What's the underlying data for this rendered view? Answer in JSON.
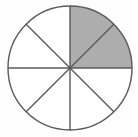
{
  "figure": {
    "name": "fraction-circle-model",
    "title": "Circle divided into eight equal sectors with two sectors shaded",
    "caption": "",
    "background_color": "#fefefe"
  },
  "chart_data": {
    "type": "pie",
    "title": "",
    "subtitle": "",
    "xlabel": "",
    "ylabel": "",
    "legend_position": "none",
    "grid": false,
    "total_slices": 8,
    "shaded_slices": 2,
    "slice_angle_degrees": 45,
    "fraction_shaded": "2/8",
    "fraction_shaded_simplified": "1/4",
    "fraction_shaded_decimal": 0.25,
    "percent_shaded": 25,
    "categories": [
      "sector-1",
      "sector-2",
      "sector-3",
      "sector-4",
      "sector-5",
      "sector-6",
      "sector-7",
      "sector-8"
    ],
    "values": [
      45,
      45,
      45,
      45,
      45,
      45,
      45,
      45
    ],
    "series": [
      {
        "name": "shaded",
        "values": [
          1,
          1,
          0,
          0,
          0,
          0,
          0,
          0
        ]
      }
    ],
    "slices": [
      {
        "id": "sector-1",
        "start_deg": -90,
        "end_deg": -45,
        "shaded": true,
        "quadrant": "upper-right"
      },
      {
        "id": "sector-2",
        "start_deg": -45,
        "end_deg": 0,
        "shaded": true,
        "quadrant": "upper-right"
      },
      {
        "id": "sector-3",
        "start_deg": 0,
        "end_deg": 45,
        "shaded": false,
        "quadrant": "lower-right"
      },
      {
        "id": "sector-4",
        "start_deg": 45,
        "end_deg": 90,
        "shaded": false,
        "quadrant": "lower-right"
      },
      {
        "id": "sector-5",
        "start_deg": 90,
        "end_deg": 135,
        "shaded": false,
        "quadrant": "lower-left"
      },
      {
        "id": "sector-6",
        "start_deg": 135,
        "end_deg": 180,
        "shaded": false,
        "quadrant": "lower-left"
      },
      {
        "id": "sector-7",
        "start_deg": 180,
        "end_deg": 225,
        "shaded": false,
        "quadrant": "upper-left"
      },
      {
        "id": "sector-8",
        "start_deg": 225,
        "end_deg": 270,
        "shaded": false,
        "quadrant": "upper-left"
      }
    ]
  },
  "geometry": {
    "center_x": 70,
    "center_y": 68,
    "radius": 62
  },
  "colors": {
    "shaded_fill": "#adadad",
    "unshaded_fill": "#ffffff",
    "outline": "#5a5a5a",
    "divider": "#5a5a5a",
    "background": "#fefefe"
  }
}
